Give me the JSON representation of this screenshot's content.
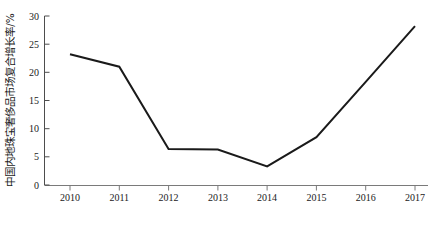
{
  "chart_data": {
    "type": "line",
    "title": "",
    "xlabel": "年份",
    "ylabel": "中国内地珠宝奢侈品市场复合增长率/%",
    "categories": [
      "2010",
      "2011",
      "2012",
      "2013",
      "2014",
      "2015",
      "2016",
      "2017"
    ],
    "x": [
      2010,
      2011,
      2012,
      2013,
      2014,
      2015,
      2016,
      2017
    ],
    "values": [
      23.2,
      21.0,
      6.4,
      6.3,
      3.3,
      8.5,
      18.3,
      28.2
    ],
    "series": [
      {
        "name": "中国内地珠宝奢侈品市场复合增长率",
        "values": [
          23.2,
          21.0,
          6.4,
          6.3,
          3.3,
          8.5,
          18.3,
          28.2
        ],
        "color": "#1a1a1a"
      }
    ],
    "xlim": [
      2010,
      2017
    ],
    "ylim": [
      0,
      30
    ],
    "ytick_labels": [
      "0",
      "5",
      "10",
      "15",
      "20",
      "25",
      "30"
    ],
    "ytick_values": [
      0,
      5,
      10,
      15,
      20,
      25,
      30
    ],
    "xtick_labels": [
      "2010",
      "2011",
      "2012",
      "2013",
      "2014",
      "2015",
      "2016",
      "2017"
    ],
    "grid": false,
    "legend": null,
    "line_color": "#1a1a1a",
    "axis_color": "#4d4d4d",
    "background": "#ffffff"
  },
  "axes": {
    "y_title": "中国内地珠宝奢侈品市场复合增长率/%",
    "x_title": "年份"
  }
}
